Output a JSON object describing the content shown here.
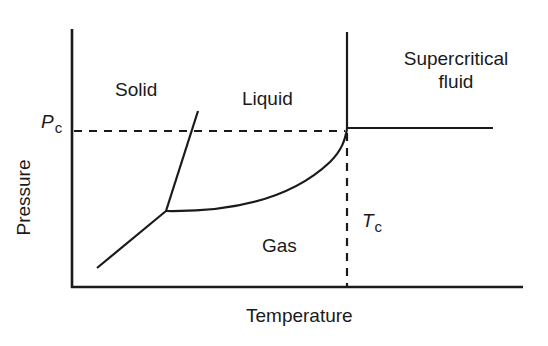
{
  "diagram": {
    "type": "phase_diagram",
    "regions": {
      "solid": "Solid",
      "liquid": "Liquid",
      "gas": "Gas",
      "supercritical_line1": "Supercritical",
      "supercritical_line2": "fluid"
    },
    "axes": {
      "xlabel": "Temperature",
      "ylabel": "Pressure"
    },
    "markers": {
      "critical_pressure_main": "P",
      "critical_pressure_sub": "c",
      "critical_temperature_main": "T",
      "critical_temperature_sub": "c"
    },
    "points": {
      "triple_point": {
        "x": 166,
        "y": 211
      },
      "critical_point": {
        "x": 347,
        "y": 129
      }
    },
    "colors": {
      "line": "#1a1a1a",
      "background": "#ffffff"
    }
  }
}
